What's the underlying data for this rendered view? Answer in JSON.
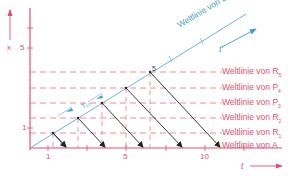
{
  "axes": {
    "y_axis_label": "x",
    "x_axis_label": "t",
    "moving_axis_label": "t'",
    "x_ticks": [
      "1",
      "5",
      "10"
    ],
    "y_ticks": [
      "1",
      "5"
    ]
  },
  "world_lines": {
    "B": "Weltlinie von B",
    "R5": "Weltlinie von R",
    "R5_sub": "5",
    "P4": "Weltlinie von P",
    "P4_sub": "4",
    "P3": "Weltlinie von P",
    "P3_sub": "3",
    "R2": "Weltlinie von R",
    "R2_sub": "2",
    "R1": "Weltlinie von R",
    "R1_sub": "1",
    "A": "Weltlinie von A"
  },
  "annotations": {
    "delta_label": "T₁₀",
    "point_label": "5"
  },
  "colors": {
    "axis": "#e0506e",
    "dashed": "#e8808f",
    "worldline_B": "#6fb3d6",
    "arrow": "#222222",
    "accent_blue": "#3a9bd0"
  }
}
